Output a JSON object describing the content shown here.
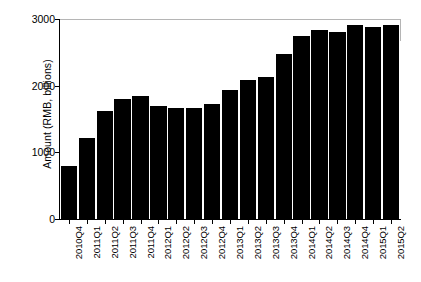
{
  "chart_data": {
    "type": "bar",
    "title": "",
    "subtitle": "",
    "xlabel": "",
    "ylabel": "Amount  (RMB, billions)",
    "categories": [
      "2010Q4",
      "2011Q1",
      "2011Q2",
      "2011Q3",
      "2011Q4",
      "2012Q1",
      "2012Q2",
      "2012Q3",
      "2012Q4",
      "2013Q1",
      "2013Q2",
      "2013Q3",
      "2013Q4",
      "2014Q1",
      "2014Q2",
      "2014Q3",
      "2014Q4",
      "2015Q1",
      "2015Q2"
    ],
    "values": [
      800,
      1210,
      1620,
      1800,
      1840,
      1700,
      1670,
      1665,
      1730,
      1940,
      2080,
      2130,
      2470,
      2750,
      2830,
      2800,
      2910,
      2880,
      2910
    ],
    "ylim": [
      0,
      3000
    ],
    "yticks": [
      0,
      1000,
      2000,
      3000
    ],
    "ytick_labels": [
      "0",
      "1000",
      "2000",
      "3000"
    ],
    "grid": false,
    "legend": null,
    "legend_position": "none",
    "bar_color": "#000000",
    "axis_color": "#000000",
    "frame_color": "#b5b5b5",
    "background": "#ffffff"
  }
}
